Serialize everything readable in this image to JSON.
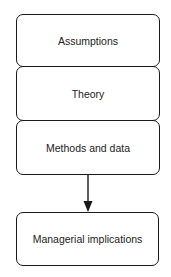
{
  "diagram": {
    "type": "flowchart",
    "nodes": [
      {
        "id": "assumptions",
        "label": "Assumptions"
      },
      {
        "id": "theory",
        "label": "Theory"
      },
      {
        "id": "methods",
        "label": "Methods and data"
      },
      {
        "id": "implications",
        "label": "Managerial implications"
      }
    ],
    "edges": [
      {
        "from": "methods",
        "to": "implications",
        "style": "arrow"
      }
    ],
    "colors": {
      "stroke": "#1a1a1a",
      "fill": "#ffffff",
      "text": "#222222"
    }
  }
}
